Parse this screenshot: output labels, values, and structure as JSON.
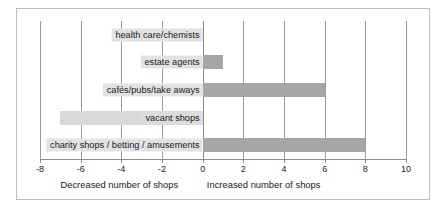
{
  "chart_data": {
    "type": "bar",
    "orientation": "horizontal",
    "title": "",
    "xlabel": "",
    "ylabel": "",
    "xlim": [
      -8,
      10
    ],
    "grid": true,
    "legend": "none",
    "xticks": [
      "-8",
      "-6",
      "-4",
      "-2",
      "0",
      "2",
      "4",
      "6",
      "8",
      "10"
    ],
    "xtick_values": [
      -8,
      -6,
      -4,
      -2,
      0,
      2,
      4,
      6,
      8,
      10
    ],
    "categories": [
      "health care/chemists",
      "estate agents",
      "cafés/pubs/take aways",
      "vacant shops",
      "charity shops / betting / amusements"
    ],
    "values": [
      0,
      1,
      6,
      -7,
      8
    ],
    "bar_colors": [
      "#d9d9d9",
      "#a6a6a6",
      "#a6a6a6",
      "#d9d9d9",
      "#a6a6a6"
    ],
    "annotations": {
      "left_caption": "Decreased number of shops",
      "right_caption": "Increased number of shops"
    },
    "colors": {
      "increase_bar": "#a6a6a6",
      "decrease_bar": "#d9d9d9",
      "gridline": "#9a9a9a",
      "axis": "#8f8f8f",
      "border": "#bfbfbf",
      "text": "#1a1a1a",
      "label_background": "#e2e2e2"
    }
  }
}
